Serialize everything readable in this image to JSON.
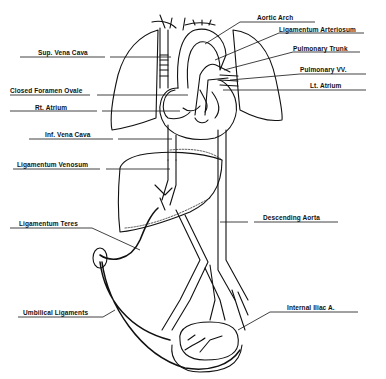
{
  "diagram": {
    "labels": {
      "aortic_arch": "Aortic Arch",
      "ligamentum_arteriosum": "Ligamentum Arteriosum",
      "pulmonary_trunk": "Pulmonary Trunk",
      "pulmonary_vv": "Pulmonary VV.",
      "lt_atrium": "Lt. Atrium",
      "sup_vena_cava": "Sup. Vena Cava",
      "closed_foramen_ovale": "Closed Foramen Ovale",
      "rt_atrium": "Rt. Atrium",
      "inf_vena_cava": "Inf. Vena Cava",
      "ligamentum_venosum": "Ligamentum Venosum",
      "descending_aorta": "Descending Aorta",
      "ligamentum_teres": "Ligamentum Teres",
      "umbilical_ligaments": "Umbilical Ligaments",
      "internal_iliac_a": "Internal Iliac A."
    }
  }
}
